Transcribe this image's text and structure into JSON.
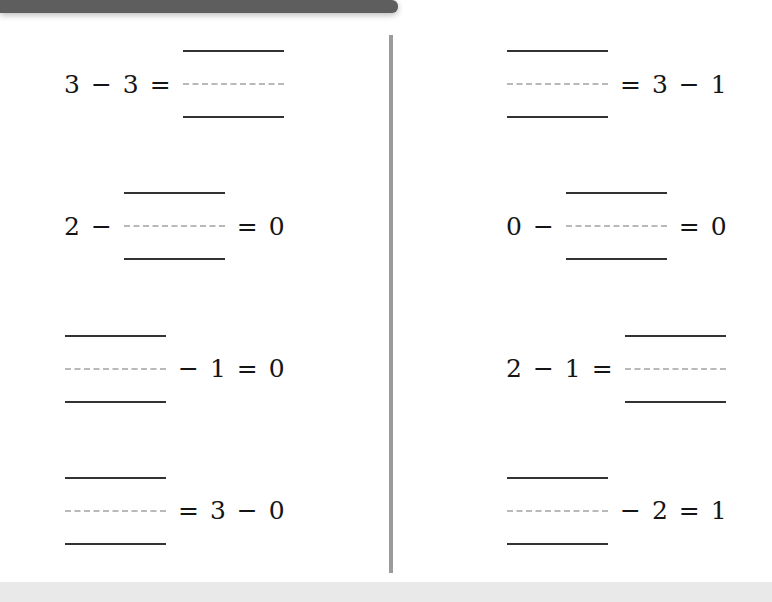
{
  "page": {
    "background_color": "#ffffff",
    "top_bar_color": "#5e5e5e",
    "bottom_bar_color": "#e9e9e9",
    "divider_color": "#9b9b9b",
    "rule_color": "#333333",
    "dashed_rule_color": "#b9b9b9"
  },
  "worksheet": {
    "columns": [
      {
        "side": "left",
        "problems": [
          {
            "id": "left-1",
            "tokens": [
              {
                "type": "term",
                "text": "3"
              },
              {
                "type": "operator",
                "text": "−"
              },
              {
                "type": "term",
                "text": "3"
              },
              {
                "type": "operator",
                "text": "="
              },
              {
                "type": "blank",
                "text": ""
              }
            ]
          },
          {
            "id": "left-2",
            "tokens": [
              {
                "type": "term",
                "text": "2"
              },
              {
                "type": "operator",
                "text": "−"
              },
              {
                "type": "blank",
                "text": ""
              },
              {
                "type": "operator",
                "text": "="
              },
              {
                "type": "term",
                "text": "0"
              }
            ]
          },
          {
            "id": "left-3",
            "tokens": [
              {
                "type": "blank",
                "text": ""
              },
              {
                "type": "operator",
                "text": "−"
              },
              {
                "type": "term",
                "text": "1"
              },
              {
                "type": "operator",
                "text": "="
              },
              {
                "type": "term",
                "text": "0"
              }
            ]
          },
          {
            "id": "left-4",
            "tokens": [
              {
                "type": "blank",
                "text": ""
              },
              {
                "type": "operator",
                "text": "="
              },
              {
                "type": "term",
                "text": "3"
              },
              {
                "type": "operator",
                "text": "−"
              },
              {
                "type": "term",
                "text": "0"
              }
            ]
          }
        ]
      },
      {
        "side": "right",
        "problems": [
          {
            "id": "right-1",
            "tokens": [
              {
                "type": "blank",
                "text": ""
              },
              {
                "type": "operator",
                "text": "="
              },
              {
                "type": "term",
                "text": "3"
              },
              {
                "type": "operator",
                "text": "−"
              },
              {
                "type": "term",
                "text": "1"
              }
            ]
          },
          {
            "id": "right-2",
            "tokens": [
              {
                "type": "term",
                "text": "0"
              },
              {
                "type": "operator",
                "text": "−"
              },
              {
                "type": "blank",
                "text": ""
              },
              {
                "type": "operator",
                "text": "="
              },
              {
                "type": "term",
                "text": "0"
              }
            ]
          },
          {
            "id": "right-3",
            "tokens": [
              {
                "type": "term",
                "text": "2"
              },
              {
                "type": "operator",
                "text": "−"
              },
              {
                "type": "term",
                "text": "1"
              },
              {
                "type": "operator",
                "text": "="
              },
              {
                "type": "blank",
                "text": ""
              }
            ]
          },
          {
            "id": "right-4",
            "tokens": [
              {
                "type": "blank",
                "text": ""
              },
              {
                "type": "operator",
                "text": "−"
              },
              {
                "type": "term",
                "text": "2"
              },
              {
                "type": "operator",
                "text": "="
              },
              {
                "type": "term",
                "text": "1"
              }
            ]
          }
        ]
      }
    ]
  }
}
